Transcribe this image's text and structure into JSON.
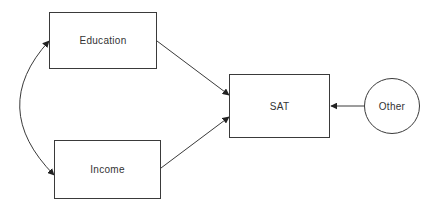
{
  "diagram": {
    "type": "path-diagram",
    "nodes": [
      {
        "id": "education",
        "label": "Education",
        "shape": "rectangle"
      },
      {
        "id": "income",
        "label": "Income",
        "shape": "rectangle"
      },
      {
        "id": "sat",
        "label": "SAT",
        "shape": "rectangle"
      },
      {
        "id": "other",
        "label": "Other",
        "shape": "circle"
      }
    ],
    "edges": [
      {
        "from": "education",
        "to": "sat",
        "type": "directed"
      },
      {
        "from": "income",
        "to": "sat",
        "type": "directed"
      },
      {
        "from": "other",
        "to": "sat",
        "type": "directed"
      },
      {
        "from": "education",
        "to": "income",
        "type": "bidirectional-curved"
      }
    ],
    "colors": {
      "stroke": "#3a3a3a",
      "background": "#ffffff",
      "text": "#333333"
    }
  }
}
